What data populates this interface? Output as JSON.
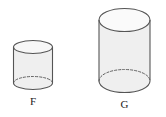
{
  "figure": {
    "type": "geometry-diagram",
    "background_color": "#ffffff",
    "stroke_color": "#595959",
    "fill_color": "#efefef",
    "hidden_edge_style": "dashed",
    "shapes": [
      {
        "id": "cylinder-f",
        "label": "F",
        "shape": "cylinder",
        "center_x": 33,
        "top_ellipse": {
          "cx": 33,
          "cy": 47,
          "rx": 19.5,
          "ry": 6.5
        },
        "bottom_ellipse": {
          "cx": 33,
          "cy": 83,
          "rx": 19.5,
          "ry": 6.5
        },
        "body_height": 36,
        "label_position": {
          "x": 33,
          "y": 105
        }
      },
      {
        "id": "cylinder-g",
        "label": "G",
        "shape": "cylinder",
        "center_x": 124.5,
        "top_ellipse": {
          "cx": 124.5,
          "cy": 20,
          "rx": 25.5,
          "ry": 11.5
        },
        "bottom_ellipse": {
          "cx": 124.5,
          "cy": 81,
          "rx": 25.5,
          "ry": 11.5
        },
        "body_height": 61,
        "label_position": {
          "x": 124.5,
          "y": 108
        }
      }
    ]
  },
  "labels": {
    "small_cylinder": "F",
    "large_cylinder": "G"
  }
}
